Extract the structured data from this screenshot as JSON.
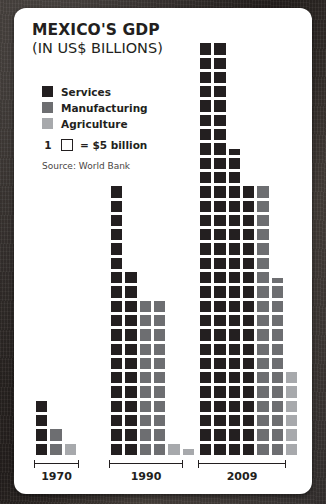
{
  "card": {
    "title_main": "MEXICO'S GDP",
    "title_sub": "(IN US$ BILLIONS)",
    "source": "Source: World Bank"
  },
  "legend": {
    "items": [
      {
        "label": "Services",
        "color": "#231f20"
      },
      {
        "label": "Manufacturing",
        "color": "#6d6e71"
      },
      {
        "label": "Agriculture",
        "color": "#a7a9ac"
      }
    ]
  },
  "unit_key": {
    "count": "1",
    "text": "= $5 billion",
    "icon": "empty-square-icon"
  },
  "colors": {
    "services": "#231f20",
    "manufacturing": "#6d6e71",
    "agriculture": "#a7a9ac",
    "card_background": "#ffffff",
    "page_background": "#2e2a27",
    "text": "#231f20"
  },
  "chart_data": {
    "type": "bar",
    "subtype": "pictogram-waffle",
    "title": "MEXICO'S GDP",
    "subtitle": "(IN US$ BILLIONS)",
    "xlabel": "",
    "ylabel": "",
    "unit_value": 5,
    "unit_label": "$5 billion per square",
    "grid": false,
    "legend_position": "top-left",
    "categories": [
      "1970",
      "1990",
      "2009"
    ],
    "series": [
      {
        "name": "Services",
        "color": "#231f20",
        "squares": [
          4,
          32,
          98
        ],
        "values": [
          20,
          160,
          490
        ]
      },
      {
        "name": "Manufacturing",
        "color": "#6d6e71",
        "squares": [
          2,
          22,
          31
        ],
        "values": [
          10,
          110,
          155
        ]
      },
      {
        "name": "Agriculture",
        "color": "#a7a9ac",
        "squares": [
          1,
          1.5,
          6
        ],
        "values": [
          5,
          7.5,
          30
        ]
      }
    ],
    "columns": [
      {
        "group": "1970",
        "series": "Services",
        "count": 4
      },
      {
        "group": "1970",
        "series": "Manufacturing",
        "count": 2
      },
      {
        "group": "1970",
        "series": "Agriculture",
        "count": 1
      },
      {
        "group": "1990",
        "series": "Services",
        "count": 19
      },
      {
        "group": "1990",
        "series": "Services",
        "count": 13
      },
      {
        "group": "1990",
        "series": "Manufacturing",
        "count": 11
      },
      {
        "group": "1990",
        "series": "Manufacturing",
        "count": 11
      },
      {
        "group": "1990",
        "series": "Agriculture",
        "count": 1
      },
      {
        "group": "1990",
        "series": "Agriculture",
        "count": 0.5
      },
      {
        "group": "2009",
        "series": "Services",
        "count": 29
      },
      {
        "group": "2009",
        "series": "Services",
        "count": 29
      },
      {
        "group": "2009",
        "series": "Services",
        "count": 21.5
      },
      {
        "group": "2009",
        "series": "Services",
        "count": 19
      },
      {
        "group": "2009",
        "series": "Manufacturing",
        "count": 19
      },
      {
        "group": "2009",
        "series": "Manufacturing",
        "count": 12.5
      },
      {
        "group": "2009",
        "series": "Agriculture",
        "count": 6
      }
    ]
  },
  "axis": {
    "groups": [
      {
        "label": "1970"
      },
      {
        "label": "1990"
      },
      {
        "label": "2009"
      }
    ]
  }
}
